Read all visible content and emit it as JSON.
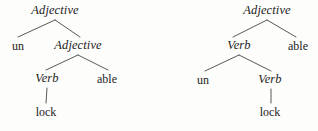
{
  "figure": {
    "background_color": "#fdfdfb",
    "ink_color": "#1c1c1c",
    "edge_color": "#3a3a3a",
    "width": 318,
    "height": 131
  },
  "trees": [
    {
      "id": "tree-left",
      "reading": "un + (lock + able)",
      "nodes": [
        {
          "id": "L0",
          "label": "Adjective",
          "style": "italic",
          "x": 55,
          "y": 11
        },
        {
          "id": "L1",
          "label": "un",
          "style": "roman",
          "x": 18,
          "y": 46
        },
        {
          "id": "L2",
          "label": "Adjective",
          "style": "italic",
          "x": 78,
          "y": 46
        },
        {
          "id": "L3",
          "label": "Verb",
          "style": "italic",
          "x": 47,
          "y": 79
        },
        {
          "id": "L4",
          "label": "able",
          "style": "roman",
          "x": 107,
          "y": 79
        },
        {
          "id": "L5",
          "label": "lock",
          "style": "roman",
          "x": 46,
          "y": 112
        }
      ],
      "edges": [
        {
          "x1": 55,
          "y1": 20,
          "x2": 18,
          "y2": 37
        },
        {
          "x1": 55,
          "y1": 20,
          "x2": 80,
          "y2": 37
        },
        {
          "x1": 78,
          "y1": 55,
          "x2": 46,
          "y2": 70
        },
        {
          "x1": 78,
          "y1": 55,
          "x2": 108,
          "y2": 70
        },
        {
          "x1": 47,
          "y1": 88,
          "x2": 46,
          "y2": 103
        }
      ]
    },
    {
      "id": "tree-right",
      "reading": "(un + lock) + able",
      "nodes": [
        {
          "id": "R0",
          "label": "Adjective",
          "style": "italic",
          "x": 267,
          "y": 11
        },
        {
          "id": "R1",
          "label": "Verb",
          "style": "italic",
          "x": 239,
          "y": 46
        },
        {
          "id": "R2",
          "label": "able",
          "style": "roman",
          "x": 298,
          "y": 46
        },
        {
          "id": "R3",
          "label": "un",
          "style": "roman",
          "x": 203,
          "y": 80
        },
        {
          "id": "R4",
          "label": "Verb",
          "style": "italic",
          "x": 270,
          "y": 80
        },
        {
          "id": "R5",
          "label": "lock",
          "style": "roman",
          "x": 270,
          "y": 112
        }
      ],
      "edges": [
        {
          "x1": 267,
          "y1": 20,
          "x2": 233,
          "y2": 37
        },
        {
          "x1": 267,
          "y1": 20,
          "x2": 296,
          "y2": 37
        },
        {
          "x1": 239,
          "y1": 55,
          "x2": 205,
          "y2": 71
        },
        {
          "x1": 239,
          "y1": 55,
          "x2": 271,
          "y2": 71
        },
        {
          "x1": 271,
          "y1": 89,
          "x2": 271,
          "y2": 103
        }
      ]
    }
  ]
}
